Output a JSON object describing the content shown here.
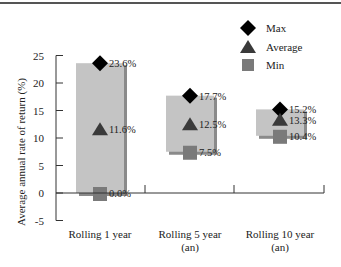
{
  "chart_data": {
    "type": "range-bar",
    "title": "",
    "xlabel": "",
    "ylabel": "Average annual rate of return (%)",
    "ylim": [
      -5,
      25
    ],
    "yticks": [
      "25",
      "20",
      "15",
      "10",
      "5",
      "0",
      "-5"
    ],
    "categories": [
      "Rolling 1 year",
      "Rolling 5 year (an)",
      "Rolling 10 year (an)"
    ],
    "category_lines": [
      [
        "Rolling 1 year"
      ],
      [
        "Rolling 5 year",
        "(an)"
      ],
      [
        "Rolling 10 year",
        "(an)"
      ]
    ],
    "series": [
      {
        "name": "Max",
        "marker": "diamond",
        "values": [
          23.6,
          17.7,
          15.2
        ],
        "labels": [
          "23.6%",
          "17.7%",
          "15.2%"
        ]
      },
      {
        "name": "Average",
        "marker": "triangle",
        "values": [
          11.6,
          12.5,
          13.3
        ],
        "labels": [
          "11.6%",
          "12.5%",
          "13.3%"
        ]
      },
      {
        "name": "Min",
        "marker": "square",
        "values": [
          0.0,
          7.5,
          10.4
        ],
        "labels": [
          "0.0%",
          "7.5%",
          "10.4%"
        ]
      }
    ],
    "legend": {
      "position": "top-right",
      "entries": [
        "Max",
        "Average",
        "Min"
      ]
    },
    "grid": false,
    "colors": {
      "bar": "#c4c4c4",
      "bar_shadow": "#8a8a8a",
      "max": "#000000",
      "average": "#3a3a3a",
      "min": "#7a7a7a",
      "axis": "#333333"
    }
  }
}
